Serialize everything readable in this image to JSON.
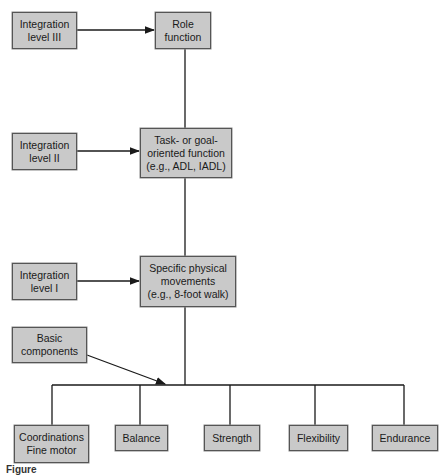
{
  "diagram": {
    "integration_levels": [
      {
        "id": "level3",
        "label": "Integration level III",
        "line1": "Integration",
        "line2": "level III"
      },
      {
        "id": "level2",
        "label": "Integration level II",
        "line1": "Integration",
        "line2": "level II"
      },
      {
        "id": "level1",
        "label": "Integration level I",
        "line1": "Integration",
        "line2": "level I"
      }
    ],
    "functions": [
      {
        "id": "role",
        "line1": "Role",
        "line2": "function"
      },
      {
        "id": "task",
        "line1": "Task- or goal-",
        "line2": "oriented function",
        "line3": "(e.g., ADL, IADL)"
      },
      {
        "id": "physical",
        "line1": "Specific physical",
        "line2": "movements",
        "line3": "(e.g., 8-foot walk)"
      }
    ],
    "basic_components": {
      "line1": "Basic",
      "line2": "components"
    },
    "components": [
      {
        "line1": "Coordinations",
        "line2": "Fine motor"
      },
      {
        "line1": "Balance"
      },
      {
        "line1": "Strength"
      },
      {
        "line1": "Flexibility"
      },
      {
        "line1": "Endurance"
      }
    ],
    "caption": "Figure",
    "colors": {
      "box_fill": "#c9c9c9",
      "box_border": "#555555",
      "line": "#1a1a1a"
    }
  }
}
